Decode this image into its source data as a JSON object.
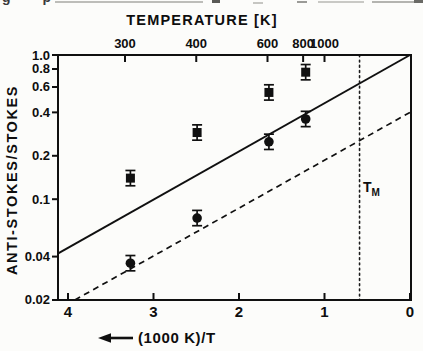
{
  "figure": {
    "background": "#fcfcfa",
    "ink": "#101010",
    "description_visible_text_only": true
  },
  "top_artifact": {
    "text": "g p"
  },
  "chart_data": {
    "type": "scatter",
    "title": "",
    "top_axis": {
      "title": "TEMPERATURE  [K]",
      "ticks": [
        {
          "t": 300,
          "label": "300"
        },
        {
          "t": 400,
          "label": "400"
        },
        {
          "t": 600,
          "label": "600"
        },
        {
          "t": 800,
          "label": "800"
        },
        {
          "t": 1000,
          "label": "1000"
        }
      ]
    },
    "bottom_axis": {
      "title": "(1000 K)/T",
      "arrow_direction": "left",
      "range": [
        4.12,
        0
      ],
      "ticks": [
        {
          "v": 4,
          "label": "4"
        },
        {
          "v": 3,
          "label": "3"
        },
        {
          "v": 2,
          "label": "2"
        },
        {
          "v": 1,
          "label": "1"
        },
        {
          "v": 0,
          "label": "0"
        }
      ]
    },
    "left_axis": {
      "title": "ANTI-STOKES/STOKES",
      "scale": "log",
      "range": [
        0.02,
        1.0
      ],
      "ticks": [
        {
          "v": 1.0,
          "label": "1.0"
        },
        {
          "v": 0.8,
          "label": "0.8"
        },
        {
          "v": 0.6,
          "label": "0.6"
        },
        {
          "v": 0.4,
          "label": "0.4"
        },
        {
          "v": 0.2,
          "label": "0.2"
        },
        {
          "v": 0.1,
          "label": "0.1"
        },
        {
          "v": 0.04,
          "label": "0.04"
        },
        {
          "v": 0.02,
          "label": "0.02"
        }
      ]
    },
    "series": [
      {
        "name": "square-points",
        "marker": "square",
        "err_pct": 13,
        "points": [
          {
            "x": 3.27,
            "ratio": 0.14
          },
          {
            "x": 2.49,
            "ratio": 0.29
          },
          {
            "x": 1.65,
            "ratio": 0.55
          },
          {
            "x": 1.22,
            "ratio": 0.76
          }
        ]
      },
      {
        "name": "circle-points",
        "marker": "circle",
        "err_pct": 13,
        "points": [
          {
            "x": 3.27,
            "ratio": 0.036
          },
          {
            "x": 2.49,
            "ratio": 0.074
          },
          {
            "x": 1.65,
            "ratio": 0.25
          },
          {
            "x": 1.22,
            "ratio": 0.36
          }
        ]
      }
    ],
    "ref_lines": [
      {
        "name": "solid-theory-line",
        "style": "solid",
        "p1": {
          "x": 4.12,
          "ratio": 0.042
        },
        "p2": {
          "x": 0,
          "ratio": 1.0
        }
      },
      {
        "name": "dashed-theory-line",
        "style": "dashed",
        "p1": {
          "x": 3.92,
          "ratio": 0.02
        },
        "p2": {
          "x": 0,
          "ratio": 0.4
        }
      },
      {
        "name": "melting-temperature-line",
        "style": "dotted-vertical",
        "x": 0.59
      }
    ],
    "annotations": [
      {
        "name": "melting-temperature-label",
        "main": "T",
        "sub": "M",
        "x": 0.55,
        "ratio": 0.112
      }
    ]
  }
}
